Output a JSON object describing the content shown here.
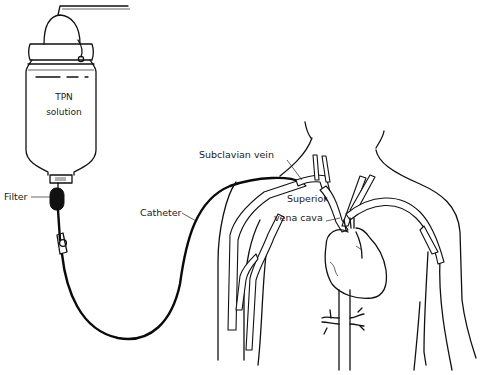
{
  "diagram": {
    "labels": {
      "bag_line1": "TPN",
      "bag_line2": "solution",
      "filter": "Filter",
      "catheter": "Catheter",
      "subclavian": "Subclavian vein",
      "svc_line1": "Superior",
      "svc_line2": "vena cava"
    },
    "components": [
      {
        "id": "tpn-bag",
        "label": "TPN solution"
      },
      {
        "id": "filter",
        "label": "Filter"
      },
      {
        "id": "roller-clamp",
        "label": ""
      },
      {
        "id": "catheter",
        "label": "Catheter"
      },
      {
        "id": "subclavian-vein",
        "label": "Subclavian vein"
      },
      {
        "id": "superior-vena-cava",
        "label": "Superior vena cava"
      },
      {
        "id": "heart",
        "label": ""
      }
    ],
    "colors": {
      "background": "#ffffff",
      "ink": "#111111"
    }
  }
}
